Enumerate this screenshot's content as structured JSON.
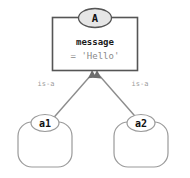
{
  "diagram": {
    "type": "class-instance-diagram",
    "background_color": "#ffffff",
    "class_node": {
      "name": "A",
      "name_badge_fill": "#e6e6e6",
      "body_stroke": "#555555",
      "attributes": [
        {
          "name": "message",
          "value": "= 'Hello'"
        }
      ]
    },
    "instances": [
      {
        "name": "a1",
        "badge_fill": "#ffffff",
        "stroke": "#9a9a9a"
      },
      {
        "name": "a2",
        "badge_fill": "#ffffff",
        "stroke": "#9a9a9a"
      }
    ],
    "edges": [
      {
        "label": "is-a",
        "from": "a1",
        "to": "A",
        "color": "#8c8c8c"
      },
      {
        "label": "is-a",
        "from": "a2",
        "to": "A",
        "color": "#8c8c8c"
      }
    ]
  }
}
